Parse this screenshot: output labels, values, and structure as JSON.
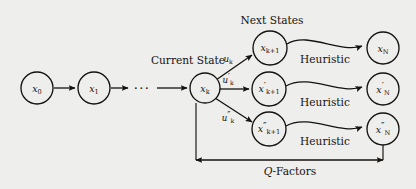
{
  "figure": {
    "background_color": "#eeeeec",
    "ink_color": "#14120f",
    "width": 416,
    "height": 189
  },
  "labels": {
    "current_state": "Current State",
    "next_states": "Next States",
    "q_factors_italic": "Q",
    "q_factors_rest": "-Factors",
    "ellipsis": "···",
    "heuristic_1": "Heuristic",
    "heuristic_2": "Heuristic",
    "heuristic_3": "Heuristic"
  },
  "nodes": {
    "x0": {
      "base": "x",
      "sub": "0",
      "prime": "",
      "cx": 37,
      "cy": 88,
      "r": 16
    },
    "x1": {
      "base": "x",
      "sub": "1",
      "prime": "",
      "cx": 94,
      "cy": 88,
      "r": 16
    },
    "xk": {
      "base": "x",
      "sub": "k",
      "prime": "",
      "cx": 205,
      "cy": 88,
      "r": 15
    },
    "xk1": {
      "base": "x",
      "sub": "k+1",
      "prime": "",
      "cx": 270,
      "cy": 48,
      "r": 17
    },
    "xk1p": {
      "base": "x",
      "sub": "k+1",
      "prime": "′",
      "cx": 269,
      "cy": 89,
      "r": 17
    },
    "xk1pp": {
      "base": "x",
      "sub": "k+1",
      "prime": "″",
      "cx": 269,
      "cy": 129,
      "r": 17
    },
    "xN": {
      "base": "x",
      "sub": "N",
      "prime": "",
      "cx": 383,
      "cy": 48,
      "r": 16
    },
    "xNp": {
      "base": "x",
      "sub": "N",
      "prime": "′",
      "cx": 383,
      "cy": 89,
      "r": 16
    },
    "xNpp": {
      "base": "x",
      "sub": "N",
      "prime": "″",
      "cx": 383,
      "cy": 129,
      "r": 16
    }
  },
  "controls": {
    "uk": {
      "base": "u",
      "sub": "k",
      "prime": "",
      "x": 228,
      "y": 62
    },
    "ukp": {
      "base": "u",
      "sub": "k",
      "prime": "′",
      "x": 228,
      "y": 83
    },
    "ukpp": {
      "base": "u",
      "sub": "k",
      "prime": "″",
      "x": 228,
      "y": 121
    }
  }
}
